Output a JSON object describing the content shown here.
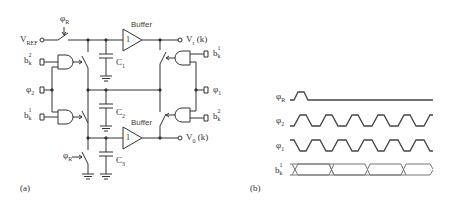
{
  "figure": {
    "panel_a": {
      "caption": "(a)",
      "inputs": {
        "vref": {
          "main": "V",
          "sub": "REF"
        },
        "phi_r_top": {
          "main": "φ",
          "sub": "R"
        },
        "b_k2_left": {
          "main": "b",
          "sub": "k",
          "sup": "2"
        },
        "phi_2": {
          "main": "φ",
          "sub": "2"
        },
        "b_k1_left": {
          "main": "b",
          "sub": "k",
          "sup": "1"
        },
        "phi_r_bottom": {
          "main": "φ",
          "sub": "R"
        }
      },
      "capacitors": [
        {
          "main": "C",
          "sub": "1"
        },
        {
          "main": "C",
          "sub": "2"
        },
        {
          "main": "C",
          "sub": "3"
        }
      ],
      "buffers": [
        {
          "label": "Buffer",
          "glyph": "1"
        },
        {
          "label": "Buffer",
          "glyph": "1"
        }
      ],
      "outputs": {
        "vr": {
          "main": "V",
          "sub": "r",
          "suffix": "(k)"
        },
        "v0": {
          "main": "V",
          "sub": "0",
          "suffix": "(k)"
        }
      },
      "right_inputs": {
        "b_k1_right": {
          "main": "b",
          "sub": "k",
          "sup": "1"
        },
        "phi_1": {
          "main": "φ",
          "sub": "1"
        },
        "b_k2_right": {
          "main": "b",
          "sub": "k",
          "sup": "2"
        }
      }
    },
    "panel_b": {
      "caption": "(b)",
      "signals": [
        {
          "name": "φR",
          "main": "φ",
          "sub": "R",
          "pattern": "single-pulse"
        },
        {
          "name": "φ2",
          "main": "φ",
          "sub": "2",
          "pattern": "clock"
        },
        {
          "name": "φ1",
          "main": "φ",
          "sub": "1",
          "pattern": "clock-inverted"
        },
        {
          "name": "b_k^1",
          "main": "b",
          "sub": "k",
          "sup": "1",
          "pattern": "data-bus"
        }
      ]
    },
    "colors": {
      "line": "#333333",
      "wave": "#444444",
      "bus": "#777777",
      "background": "#ffffff"
    }
  }
}
